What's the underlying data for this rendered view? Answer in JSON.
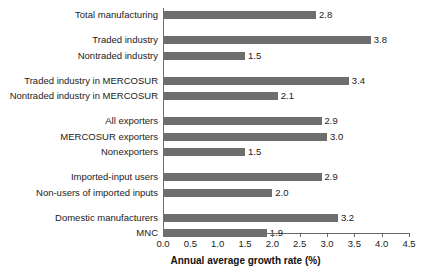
{
  "chart_data": {
    "type": "bar",
    "orientation": "horizontal",
    "title": "",
    "subtitle": "",
    "xlabel": "Annual average growth rate (%)",
    "ylabel": "",
    "xlim": [
      0.0,
      4.5
    ],
    "grid": false,
    "legend": null,
    "legend_position": "none",
    "bar_color": "#6e6e6e",
    "axis_color": "#6b6b6b",
    "text_color": "#1a1a1a",
    "value_label_format": "one-decimal",
    "xticks": [
      "0.0",
      "0.5",
      "1.0",
      "1.5",
      "2.0",
      "2.5",
      "3.0",
      "3.5",
      "4.0",
      "4.5"
    ],
    "xtick_values": [
      0.0,
      0.5,
      1.0,
      1.5,
      2.0,
      2.5,
      3.0,
      3.5,
      4.0,
      4.5
    ],
    "categories": [
      "Total manufacturing",
      "Traded industry",
      "Nontraded industry",
      "Traded industry in MERCOSUR",
      "Nontraded industry in MERCOSUR",
      "All exporters",
      "MERCOSUR exporters",
      "Nonexporters",
      "Imported-input users",
      "Non-users of imported inputs",
      "Domestic manufacturers",
      "MNC"
    ],
    "values": [
      2.8,
      3.8,
      1.5,
      3.4,
      2.1,
      2.9,
      3.0,
      1.5,
      2.9,
      2.0,
      3.2,
      1.9
    ],
    "value_labels": [
      "2.8",
      "3.8",
      "1.5",
      "3.4",
      "2.1",
      "2.9",
      "3.0",
      "1.5",
      "2.9",
      "2.0",
      "3.2",
      "1.9"
    ],
    "groups": [
      {
        "name": "total",
        "size": 1
      },
      {
        "name": "traded-nontraded",
        "size": 2
      },
      {
        "name": "mercosur-traded-nontraded",
        "size": 2
      },
      {
        "name": "exporter-status",
        "size": 3
      },
      {
        "name": "imported-input-use",
        "size": 2
      },
      {
        "name": "ownership",
        "size": 2
      }
    ]
  }
}
